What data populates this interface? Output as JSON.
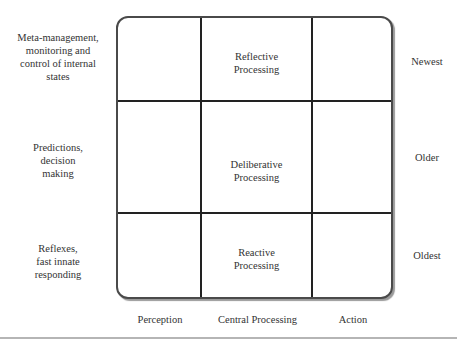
{
  "diagram": {
    "row_labels": [
      "Meta-management, monitoring and control of internal states",
      "Predictions, decision making",
      "Reflexes, fast innate responding"
    ],
    "row_labels_lines": [
      [
        "Meta-management,",
        "monitoring and",
        "control of internal",
        "states"
      ],
      [
        "Predictions,",
        "decision",
        "making"
      ],
      [
        "Reflexes,",
        "fast innate",
        "responding"
      ]
    ],
    "age_labels": [
      "Newest",
      "Older",
      "Oldest"
    ],
    "column_labels": [
      "Perception",
      "Central Processing",
      "Action"
    ],
    "cells": [
      {
        "row": 0,
        "col": 1,
        "lines": [
          "Reflective",
          "Processing"
        ]
      },
      {
        "row": 1,
        "col": 1,
        "lines": [
          "Deliberative",
          "Processing"
        ]
      },
      {
        "row": 2,
        "col": 1,
        "lines": [
          "Reactive",
          "Processing"
        ]
      }
    ]
  }
}
